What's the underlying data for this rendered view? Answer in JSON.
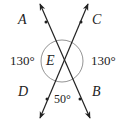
{
  "diagram": {
    "type": "intersecting-lines",
    "intersection_point": "E",
    "lines": [
      {
        "name": "line-AB",
        "from": "A",
        "to": "B"
      },
      {
        "name": "line-CD",
        "from": "C",
        "to": "D"
      }
    ],
    "point_labels": {
      "A": "A",
      "B": "B",
      "C": "C",
      "D": "D",
      "E": "E"
    },
    "angles": {
      "left": "130°",
      "right": "130°",
      "bottom": "50°"
    },
    "colors": {
      "line": "#222222",
      "circle": "#777777",
      "text": "#222222"
    }
  }
}
